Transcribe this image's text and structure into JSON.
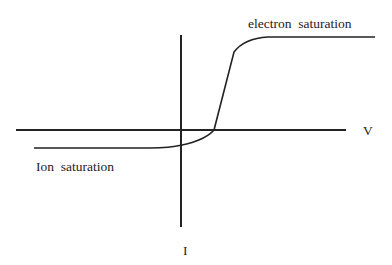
{
  "diagram": {
    "labels": {
      "electron_saturation": "electron  saturation",
      "ion_saturation": "Ion  saturation",
      "x_axis": "V",
      "y_axis": "I"
    },
    "colors": {
      "line": "#222222",
      "background": "#ffffff"
    }
  }
}
